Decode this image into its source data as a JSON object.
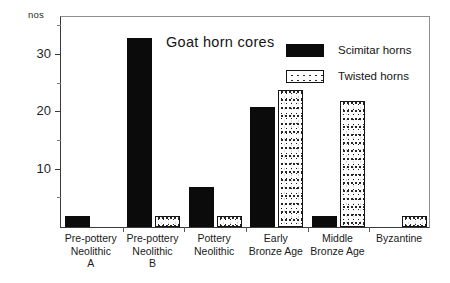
{
  "axis": {
    "y_unit_label": "nos",
    "y_major_ticks": [
      "10",
      "20",
      "30"
    ],
    "y_major_values": [
      10,
      20,
      30
    ],
    "y_minor_values": [
      5,
      15,
      25,
      35
    ]
  },
  "legend": {
    "position": "top-right inside plot",
    "entries": [
      {
        "label": "Scimitar horns",
        "swatch": "solid-black"
      },
      {
        "label": "Twisted horns",
        "swatch": "stippled-white"
      }
    ]
  },
  "chart_data": {
    "type": "bar",
    "title": "Goat horn cores",
    "xlabel": "",
    "ylabel": "nos",
    "ylim": [
      0,
      37
    ],
    "grid": false,
    "legend_position": "top-right",
    "categories": [
      "Pre-pottery Neolithic A",
      "Pre-pottery Neolithic B",
      "Pottery Neolithic",
      "Early Bronze Age",
      "Middle Bronze Age",
      "Byzantine"
    ],
    "category_lines": [
      [
        "Pre-pottery",
        "Neolithic",
        "A"
      ],
      [
        "Pre-pottery",
        "Neolithic",
        "B"
      ],
      [
        "Pottery",
        "Neolithic"
      ],
      [
        "Early",
        "Bronze Age"
      ],
      [
        "Middle",
        "Bronze Age"
      ],
      [
        "Byzantine"
      ]
    ],
    "series": [
      {
        "name": "Scimitar horns",
        "values": [
          2,
          33,
          7,
          21,
          2,
          0
        ]
      },
      {
        "name": "Twisted horns",
        "values": [
          0,
          2,
          2,
          24,
          22,
          2
        ]
      }
    ]
  }
}
